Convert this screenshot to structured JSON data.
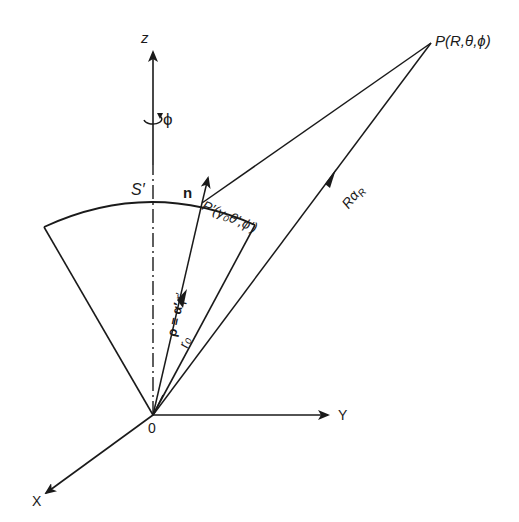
{
  "diagram": {
    "type": "coordinate-geometry",
    "colors": {
      "ink": "#1a1a1a",
      "background": "#ffffff"
    },
    "axes": {
      "z": {
        "label": "z"
      },
      "y": {
        "label": "Y"
      },
      "x": {
        "label": "X"
      },
      "origin": {
        "label": "0"
      }
    },
    "labels": {
      "phi_rotation": "ϕ",
      "surface": "S′",
      "normal": "n",
      "source_point": "P′(γ₀θ′,ϕ′)",
      "field_point": "P(R,θ,ϕ)",
      "field_vector": "Rα",
      "field_vector_sub": "R",
      "source_vector": "ρ = α′",
      "source_vector_sub": "r",
      "source_vector_suffix": "r′",
      "radius": "r₀"
    }
  }
}
